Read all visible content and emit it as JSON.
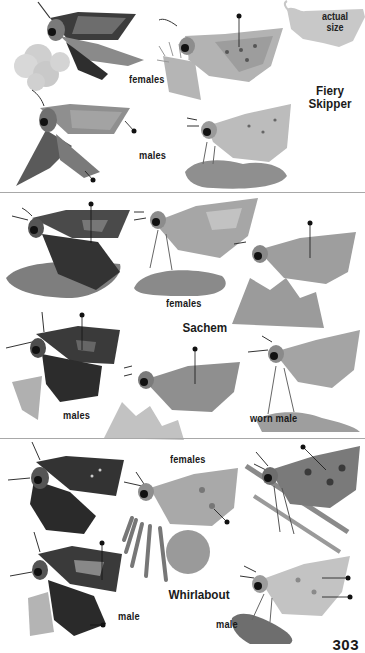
{
  "page": {
    "page_number": "303",
    "palette": {
      "background": "#ffffff",
      "text": "#1a1a1a",
      "divider": "#a8a8a8",
      "silhouette": "#c8c8c8",
      "wing_dark": "#3c3c3c",
      "wing_mid": "#8a8a8a",
      "wing_light": "#b9b9b9",
      "perch": "#9a9a9a"
    }
  },
  "sections": [
    {
      "species": "Fiery Skipper",
      "title_lines": [
        "Fiery",
        "Skipper"
      ],
      "actual_size": {
        "label_lines": [
          "actual",
          "size"
        ]
      },
      "labels": {
        "females": "females",
        "males": "males"
      }
    },
    {
      "species": "Sachem",
      "title_lines": [
        "Sachem"
      ],
      "labels": {
        "females": "females",
        "males": "males",
        "worn_male": "worn male"
      }
    },
    {
      "species": "Whirlabout",
      "title_lines": [
        "Whirlabout"
      ],
      "labels": {
        "females": "females",
        "male_left": "male",
        "male_right": "male"
      }
    }
  ]
}
